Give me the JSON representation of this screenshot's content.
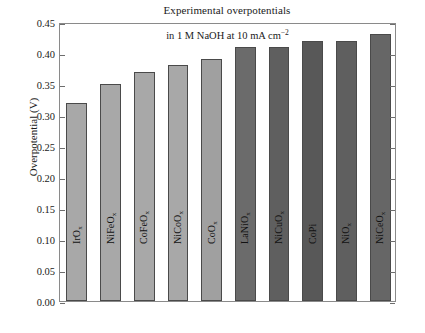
{
  "chart_data": {
    "type": "bar",
    "title": "Experimental overpotentials",
    "annotation": "in 1 M NaOH at 10 mA cm",
    "annotation_superscript": "−2",
    "xlabel": "",
    "ylabel": "Overpotential (V)",
    "ylim": [
      0.0,
      0.45
    ],
    "ytick_step": 0.05,
    "ytick_labels": [
      "0.45",
      "0.40",
      "0.35",
      "0.30",
      "0.25",
      "0.20",
      "0.15",
      "0.10",
      "0.05",
      "0.00"
    ],
    "ytick_values": [
      0.45,
      0.4,
      0.35,
      0.3,
      0.25,
      0.2,
      0.15,
      0.1,
      0.05,
      0.0
    ],
    "grid": false,
    "legend": "none",
    "categories": [
      "IrO",
      "NiFeO",
      "CoFeO",
      "NiCoO",
      "CoO",
      "LaNiO",
      "NiCuO",
      "CoPi",
      "NiO",
      "NiCeO"
    ],
    "category_subscripts": [
      "x",
      "x",
      "x",
      "x",
      "x",
      "x",
      "x",
      "",
      "x",
      "x"
    ],
    "values": [
      0.32,
      0.35,
      0.37,
      0.38,
      0.39,
      0.41,
      0.41,
      0.42,
      0.42,
      0.43
    ],
    "bar_colors": [
      "#a8a8a8",
      "#a8a8a8",
      "#a8a8a8",
      "#a8a8a8",
      "#a0a0a0",
      "#6b6b6b",
      "#5f5f5f",
      "#585858",
      "#5f5f5f",
      "#666666"
    ],
    "bar_edge_color": "#4a4a4a",
    "axis_color": "#8a8a8a",
    "background_color": "#ffffff",
    "text_color": "#1a1a1a"
  }
}
